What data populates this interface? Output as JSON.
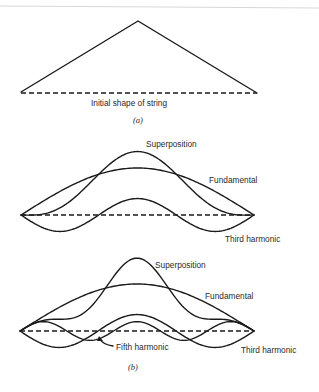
{
  "panel_a": {
    "label_initial": "Initial shape of string",
    "caption": "(a)",
    "shape": "triangle (plucked at center)"
  },
  "panel_b1": {
    "label_superposition": "Superposition",
    "label_fundamental": "Fundamental",
    "label_third": "Third harmonic",
    "components": [
      {
        "name": "Fundamental",
        "mode": 1,
        "amplitude": 1.0
      },
      {
        "name": "Third harmonic",
        "mode": 3,
        "amplitude": -0.35
      }
    ]
  },
  "panel_b2": {
    "label_superposition": "Superposition",
    "label_fundamental": "Fundamental",
    "label_fifth": "Fifth harmonic",
    "label_third": "Third harmonic",
    "caption": "(b)",
    "components": [
      {
        "name": "Fundamental",
        "mode": 1,
        "amplitude": 1.0
      },
      {
        "name": "Third harmonic",
        "mode": 3,
        "amplitude": -0.35
      },
      {
        "name": "Fifth harmonic",
        "mode": 5,
        "amplitude": 0.2
      }
    ]
  }
}
